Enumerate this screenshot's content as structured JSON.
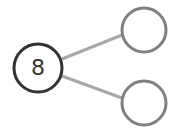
{
  "diagram": {
    "type": "number-bond",
    "whole": {
      "value": "8"
    },
    "parts": [
      {
        "value": ""
      },
      {
        "value": ""
      }
    ],
    "colors": {
      "whole_stroke": "#333333",
      "part_stroke": "#808080",
      "connector": "#a8a8a8"
    }
  }
}
